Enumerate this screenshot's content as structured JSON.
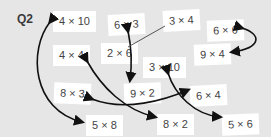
{
  "label": "Q2",
  "cards": [
    {
      "id": "c1",
      "text": "4 × 10"
    },
    {
      "id": "c2",
      "text": "6 × 3"
    },
    {
      "id": "c3",
      "text": "3 × 4"
    },
    {
      "id": "c4",
      "text": "6 × 6"
    },
    {
      "id": "c5",
      "text": "4 × 4"
    },
    {
      "id": "c6",
      "text": "2 × 6"
    },
    {
      "id": "c7",
      "text": "9 × 4"
    },
    {
      "id": "c8",
      "text": "3 × 10"
    },
    {
      "id": "c9",
      "text": "8 × 3"
    },
    {
      "id": "c10",
      "text": "9 × 2"
    },
    {
      "id": "c11",
      "text": "6 × 4"
    },
    {
      "id": "c12",
      "text": "5 × 8"
    },
    {
      "id": "c13",
      "text": "8 × 2"
    },
    {
      "id": "c14",
      "text": "5 × 6"
    }
  ],
  "pairs": [
    [
      "4 × 10",
      "5 × 8"
    ],
    [
      "6 × 3",
      "9 × 2"
    ],
    [
      "3 × 4",
      "2 × 6"
    ],
    [
      "6 × 6",
      "9 × 4"
    ],
    [
      "4 × 4",
      "8 × 2"
    ],
    [
      "8 × 3",
      "6 × 4"
    ],
    [
      "3 × 10",
      "5 × 6"
    ]
  ]
}
